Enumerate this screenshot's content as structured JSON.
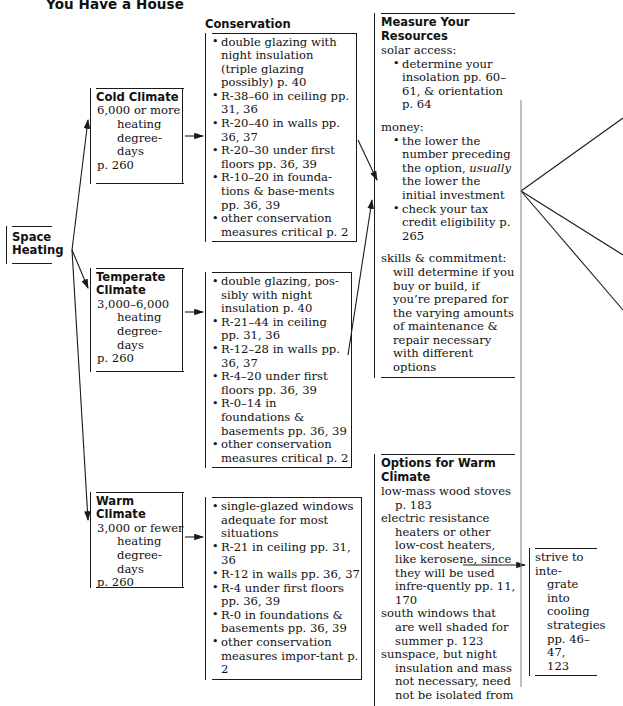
{
  "title": "You Have a House",
  "root": {
    "label_line1": "Space",
    "label_line2": "Heating"
  },
  "climates": [
    {
      "name": "Cold Climate",
      "degree_line1": "6,000 or more",
      "degree_line2": "heating",
      "degree_line3": "degree-days",
      "page": "p. 260"
    },
    {
      "name_line1": "Temperate",
      "name_line2": "Climate",
      "degree_line1": "3,000–6,000",
      "degree_line2": "heating",
      "degree_line3": "degree-days",
      "page": "p. 260"
    },
    {
      "name": "Warm Climate",
      "degree_line1": "3,000 or fewer",
      "degree_line2": "heating",
      "degree_line3": "degree-days",
      "page": "p. 260"
    }
  ],
  "conservation_cold": {
    "heading": "Conservation",
    "items": [
      "double glazing with night insulation (triple glazing possibly) p. 40",
      "R-38–60 in ceiling pp. 31, 36",
      "R-20–40 in walls pp. 36, 37",
      "R-20–30 under first floors pp. 36, 39",
      "R-10–20 in founda-tions & base-ments pp. 36, 39",
      "other conservation measures critical p. 2"
    ]
  },
  "conservation_temperate": {
    "items": [
      "double glazing, pos-sibly with night insulation p. 40",
      "R-21–44 in ceiling pp. 31, 36",
      "R-12–28 in walls pp. 36, 37",
      "R-4–20 under first floors pp. 36, 39",
      "R-0–14 in foundations & basements pp. 36, 39",
      "other conservation measures critical p. 2"
    ]
  },
  "conservation_warm": {
    "items": [
      "single-glazed windows adequate for most situations",
      "R-21 in ceiling pp. 31, 36",
      "R-12 in walls pp. 36, 37",
      "R-4 under first floors pp. 36, 39",
      "R-0 in foundations & basements pp. 36, 39",
      "other conservation measures impor-tant p. 2"
    ]
  },
  "measure_resources": {
    "heading_line1": "Measure Your",
    "heading_line2": "Resources",
    "group_solar": {
      "label": "solar access:",
      "bullets": [
        "determine your insolation pp. 60–61, & orientation p. 64"
      ]
    },
    "group_money": {
      "label": "money:",
      "bullets": [
        {
          "pre": "the lower the number preceding the option, ",
          "em": "usually",
          "post": " the lower the initial investment"
        },
        {
          "pre": "check your tax credit eligibility p. 265",
          "em": "",
          "post": ""
        }
      ]
    },
    "group_skills": {
      "label": "skills & commitment:",
      "body": "will determine if you buy or build, if you’re prepared for the varying amounts of maintenance & repair necessary with different options"
    }
  },
  "options_warm": {
    "heading_line1": "Options for Warm",
    "heading_line2": "Climate",
    "entries": [
      {
        "lead": "low-mass wood stoves",
        "cont": "p. 183"
      },
      {
        "lead": "electric resistance",
        "cont": "heaters or other low-cost heaters, like kerosene, since they will be used infre-quently pp. 11, 170"
      },
      {
        "lead": "south windows that",
        "cont": "are well shaded for summer p. 123"
      },
      {
        "lead": "sunspace, but night",
        "cont": "insulation and mass not necessary, need not be isolated from"
      }
    ]
  },
  "strive": {
    "lines": [
      "strive to inte-",
      "grate into",
      "cooling",
      "strategies",
      "pp. 46–47,",
      "123"
    ]
  }
}
